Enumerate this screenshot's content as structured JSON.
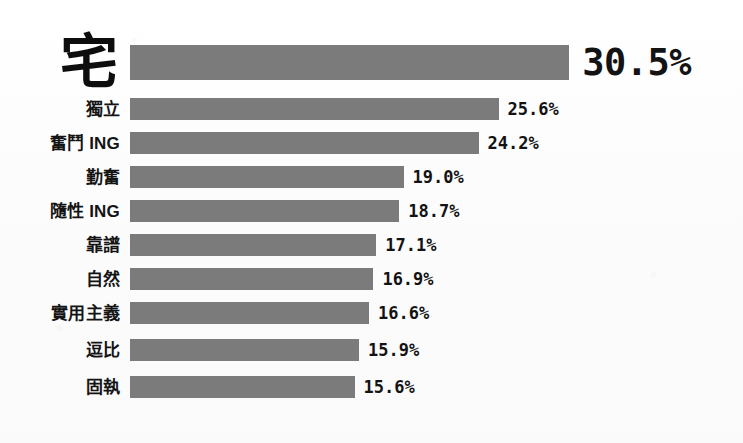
{
  "chart": {
    "background_color": "#fdfdfd",
    "bar_color": "#7b7b7b",
    "text_color": "#131313"
  },
  "chart_data": {
    "type": "bar",
    "orientation": "horizontal",
    "title": "",
    "subtitle": "",
    "xlabel": "",
    "ylabel": "",
    "grid": false,
    "legend": null,
    "axis_visible": false,
    "tick_labels": [],
    "xlim": [
      0,
      30.5
    ],
    "value_suffix": "%",
    "categories": [
      "宅",
      "獨立",
      "奮鬥 ING",
      "勤奮",
      "隨性 ING",
      "靠譜",
      "自然",
      "實用主義",
      "逗比",
      "固執"
    ],
    "values": [
      30.5,
      25.6,
      24.2,
      19.0,
      18.7,
      17.1,
      16.9,
      16.6,
      15.9,
      15.6
    ],
    "data_labels": [
      "30.5%",
      "25.6%",
      "24.2%",
      "19.0%",
      "18.7%",
      "17.1%",
      "16.9%",
      "16.6%",
      "15.9%",
      "15.6%"
    ],
    "rows": [
      {
        "label": "宅",
        "value": 30.5,
        "display": "30.5%",
        "emphasis": true
      },
      {
        "label": "獨立",
        "value": 25.6,
        "display": "25.6%",
        "emphasis": false
      },
      {
        "label": "奮鬥 ING",
        "value": 24.2,
        "display": "24.2%",
        "emphasis": false
      },
      {
        "label": "勤奮",
        "value": 19.0,
        "display": "19.0%",
        "emphasis": false
      },
      {
        "label": "隨性 ING",
        "value": 18.7,
        "display": "18.7%",
        "emphasis": false
      },
      {
        "label": "靠譜",
        "value": 17.1,
        "display": "17.1%",
        "emphasis": false
      },
      {
        "label": "自然",
        "value": 16.9,
        "display": "16.9%",
        "emphasis": false
      },
      {
        "label": "實用主義",
        "value": 16.6,
        "display": "16.6%",
        "emphasis": false
      },
      {
        "label": "逗比",
        "value": 15.9,
        "display": "15.9%",
        "emphasis": false
      },
      {
        "label": "固執",
        "value": 15.6,
        "display": "15.6%",
        "emphasis": false
      }
    ]
  }
}
